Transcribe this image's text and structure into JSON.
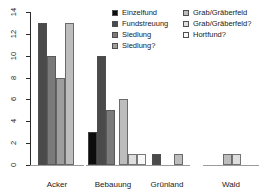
{
  "chart_data": {
    "type": "bar",
    "title": "",
    "xlabel": "",
    "ylabel": "",
    "categories": [
      "Acker",
      "Bebauung",
      "Grünland",
      "Wald"
    ],
    "series": [
      {
        "name": "Einzelfund",
        "color": "#0d0d0d",
        "values": [
          0,
          3,
          0,
          0
        ]
      },
      {
        "name": "Fundstreuung",
        "color": "#4a4a4a",
        "values": [
          13,
          10,
          1,
          0
        ]
      },
      {
        "name": "Siedlung",
        "color": "#7a7a7a",
        "values": [
          10,
          5,
          0,
          0
        ]
      },
      {
        "name": "Siedlung?",
        "color": "#9e9e9e",
        "values": [
          8,
          0,
          0,
          0
        ]
      },
      {
        "name": "Grab/Gräberfeld",
        "color": "#bdbdbd",
        "values": [
          13,
          6,
          1,
          1
        ]
      },
      {
        "name": "Grab/Gräberfeld?",
        "color": "#dedede",
        "values": [
          0,
          1,
          0,
          1
        ]
      },
      {
        "name": "Hortfund?",
        "color": "#f8f8f8",
        "values": [
          0,
          1,
          0,
          0
        ]
      }
    ],
    "ylim": [
      0,
      14
    ],
    "yticks": [
      0,
      2,
      4,
      6,
      8,
      10,
      12,
      14
    ],
    "legend_position": "top-right",
    "grid": false
  }
}
